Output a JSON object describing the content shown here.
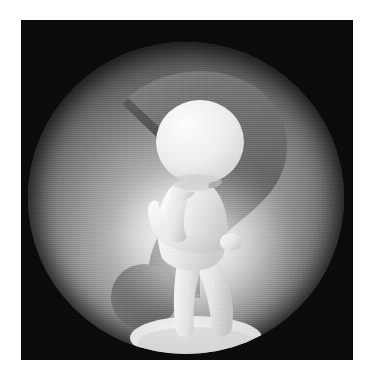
{
  "canvas": {
    "width": 373,
    "height": 380,
    "page_background": "#ffffff"
  },
  "photo": {
    "x": 21,
    "y": 20,
    "width": 332,
    "height": 340,
    "background_color": "#0b0b0b",
    "description": "Dark square photographic plate"
  },
  "sphere": {
    "center_x": 186,
    "center_y": 197,
    "radius": 158,
    "highlight_color": "#e8e8e8",
    "midtone_color": "#8a8a8a",
    "shadow_color": "#3a3a3a",
    "description": "Large glowing grey sphere filling the plate"
  },
  "question_mark": {
    "color": "#6f6f6f",
    "shadow_color": "#565656",
    "hook_description": "Thick grey question mark with flat cut tail end",
    "dot": {
      "center_x": 144,
      "center_y": 277,
      "radius": 33,
      "color": "#6f6f6f"
    }
  },
  "figure": {
    "body_color": "#ededed",
    "shade_color": "#c9c9c9",
    "pose": "thinking",
    "parts": [
      "head",
      "torso",
      "left-arm",
      "right-arm-chin",
      "legs",
      "base-shadow"
    ]
  },
  "glow": {
    "color": "#ffffff",
    "center_x": 176,
    "center_y": 228
  },
  "accessibility": {
    "alt_text": "A white 3D figure in a thinking pose standing in front of a large question mark on a glowing grey sphere"
  }
}
